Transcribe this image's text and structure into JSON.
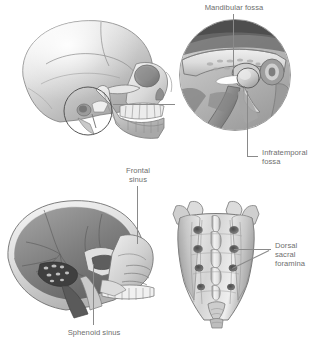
{
  "figure": {
    "background_color": "#ffffff",
    "label_color": "#6e6e6e",
    "leader_color": "#8a8a8a",
    "width": 323,
    "height": 355
  },
  "labels": {
    "mandibular_fossa": "Mandibular fossa",
    "infratemporal_fossa": "Infratemporal\nfossa",
    "frontal_sinus": "Frontal\nsinus",
    "sphenoid_sinus": "Sphenoid sinus",
    "dorsal_sacral_foramina": "Dorsal\nsacral\nforamina"
  },
  "panels": {
    "lateral_skull": "lateral-skull-illustration",
    "tmj_inset": "temporomandibular-joint-inset",
    "sagittal_skull": "midsagittal-skull-illustration",
    "sacrum": "posterior-sacrum-illustration"
  },
  "icons": {
    "roi_circle": "region-of-interest-circle"
  }
}
